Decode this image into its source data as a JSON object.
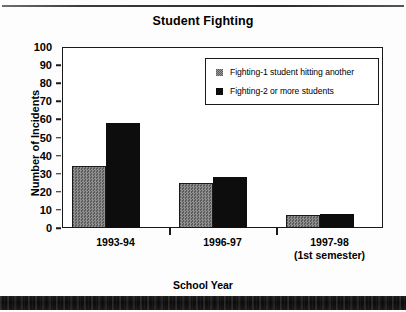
{
  "chart_data": {
    "type": "bar",
    "title": "Student Fighting",
    "xlabel": "School Year",
    "ylabel": "Number of Incidents",
    "categories": [
      "1993-94",
      "1996-97",
      "1997-98"
    ],
    "category_sublabels": [
      "",
      "",
      "(1st semester)"
    ],
    "series": [
      {
        "name": "Fighting-1 student hitting another",
        "color": "#7d7d7d",
        "values": [
          34,
          25,
          7
        ]
      },
      {
        "name": "Fighting-2 or more  students",
        "color": "#0d0d0d",
        "values": [
          58,
          28,
          8
        ]
      }
    ],
    "ylim": [
      0,
      100
    ],
    "yticks": [
      0,
      10,
      20,
      30,
      40,
      50,
      60,
      70,
      80,
      90,
      100
    ],
    "ytick_labels": [
      "0",
      "10",
      "20",
      "30",
      "40",
      "50",
      "60",
      "70",
      "80",
      "90",
      "100"
    ],
    "grid": false,
    "legend_position": "top-right"
  },
  "legend": {
    "entries": [
      {
        "label": "Fighting-1 student hitting another"
      },
      {
        "label": "Fighting-2 or more  students"
      }
    ]
  }
}
